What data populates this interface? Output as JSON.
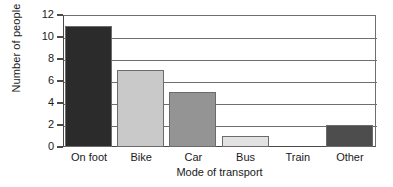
{
  "chart_data": {
    "type": "bar",
    "title": "",
    "subtitle": "",
    "xlabel": "Mode of transport",
    "ylabel": "Number of people",
    "categories": [
      "On foot",
      "Bike",
      "Car",
      "Bus",
      "Train",
      "Other"
    ],
    "values": [
      11,
      7,
      5,
      1,
      0,
      2
    ],
    "bar_colors": [
      "#2b2b2b",
      "#c9c9c9",
      "#949494",
      "#e2e2e2",
      "#ffffff",
      "#4d4d4d"
    ],
    "bar_border_color": "#6b6b6b",
    "ylim": [
      0,
      12
    ],
    "ytick_step": 2,
    "ytick_labels": [
      "0",
      "2",
      "4",
      "6",
      "8",
      "10",
      "12"
    ],
    "grid": true,
    "grid_axis": "y",
    "grid_color": "#6e6e6e",
    "legend": false,
    "legend_position": "none",
    "axis_color": "#4a4a4a",
    "background_color": "#ffffff"
  }
}
